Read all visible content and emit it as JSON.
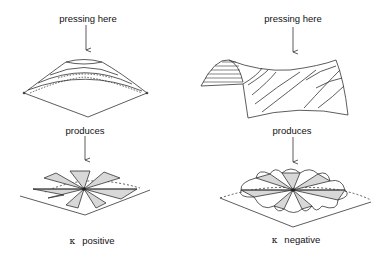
{
  "diagram": {
    "type": "curvature-illustration",
    "colors": {
      "line": "#333333",
      "fill": "#d8d8d8",
      "background": "#ffffff"
    },
    "panels": [
      {
        "id": "positive",
        "top_label": "pressing here",
        "middle_label": "produces",
        "kappa_symbol": "κ",
        "bottom_label": "positive",
        "surface": "dome",
        "result": "star of flat triangular wedges"
      },
      {
        "id": "negative",
        "top_label": "pressing here",
        "middle_label": "produces",
        "kappa_symbol": "κ",
        "bottom_label": "negative",
        "surface": "saddle",
        "result": "ruffled star of wedges with excess"
      }
    ]
  }
}
